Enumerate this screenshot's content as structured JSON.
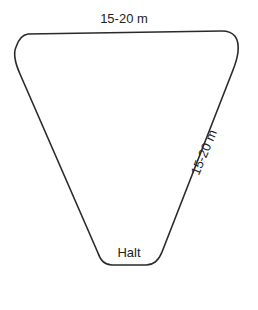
{
  "diagram": {
    "type": "riding-figure",
    "shape": "inverted-triangle-with-rounded-corners",
    "stroke_color": "#2a2a2a",
    "background": "#ffffff",
    "labels": {
      "top_side": "15-20 m",
      "right_side": "15-20 m",
      "bottom_point": "Halt"
    }
  }
}
